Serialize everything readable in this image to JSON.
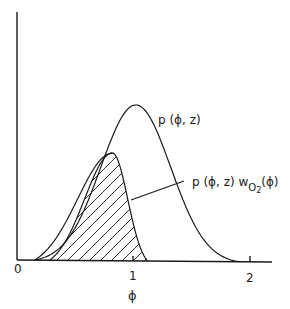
{
  "figure": {
    "x_axis_label": "ϕ",
    "x_ticks": [
      "0",
      "1",
      "2"
    ],
    "curve_labels": {
      "pdf": "p (ϕ, z)",
      "weighted_prefix": "p (ϕ, z)  w",
      "weighted_sub": "O",
      "weighted_sub2": "2",
      "weighted_suffix": "(ϕ)"
    }
  },
  "chart_data": {
    "type": "line",
    "title": "",
    "xlabel": "ϕ",
    "ylabel": "",
    "xlim": [
      0,
      2.2
    ],
    "x_ticks": [
      0,
      1,
      2
    ],
    "grid": false,
    "series": [
      {
        "name": "p(ϕ, z)",
        "peak_x": 1.02,
        "support": [
          0.15,
          1.9
        ],
        "relative_peak": 1.0
      },
      {
        "name": "p(ϕ, z) wO2(ϕ)",
        "peak_x": 0.82,
        "support": [
          0.15,
          1.12
        ],
        "relative_peak": 0.69,
        "shaded": "hatched"
      }
    ]
  }
}
